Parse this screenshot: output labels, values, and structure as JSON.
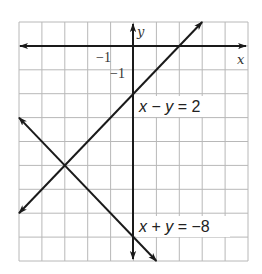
{
  "graph": {
    "grid": {
      "x_min": -5,
      "x_max": 5,
      "y_min": -9,
      "y_max": 1,
      "left_px": 19,
      "top_px": 22,
      "right_px": 248,
      "bottom_px": 261,
      "grid_color": "#b8b8b8",
      "axis_color": "#1a1a1a"
    },
    "axis_labels": {
      "x": "x",
      "y": "y"
    },
    "tick_labels": {
      "x_neg_one": "−1",
      "y_neg_one": "−1"
    },
    "lines": [
      {
        "name": "x-minus-y-equals-2",
        "equation": "x − y = 2",
        "label_parts": [
          "x",
          " − ",
          "y",
          " = 2"
        ],
        "from": [
          -5,
          -7
        ],
        "to": [
          3,
          1
        ],
        "arrows": "both"
      },
      {
        "name": "x-plus-y-equals-neg-8",
        "equation": "x + y = −8",
        "label_parts": [
          "x",
          " + ",
          "y",
          " = −8"
        ],
        "from": [
          -5,
          -3
        ],
        "to": [
          1,
          -9
        ],
        "arrows": "both"
      }
    ],
    "intersection": [
      -3,
      -5
    ]
  }
}
